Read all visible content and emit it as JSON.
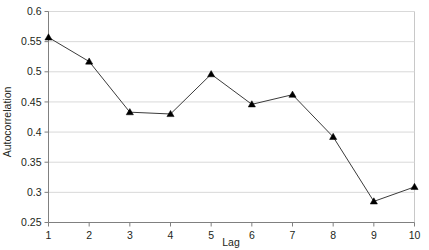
{
  "chart_data": {
    "type": "line",
    "title": "",
    "xlabel": "Lag",
    "ylabel": "Autocorrelation",
    "x": [
      1,
      2,
      3,
      4,
      5,
      6,
      7,
      8,
      9,
      10
    ],
    "categories": [
      "1",
      "2",
      "3",
      "4",
      "5",
      "6",
      "7",
      "8",
      "9",
      "10"
    ],
    "values": [
      0.557,
      0.517,
      0.433,
      0.43,
      0.496,
      0.446,
      0.462,
      0.392,
      0.285,
      0.309
    ],
    "series": [
      {
        "name": "Autocorrelation",
        "values": [
          0.557,
          0.517,
          0.433,
          0.43,
          0.496,
          0.446,
          0.462,
          0.392,
          0.285,
          0.309
        ]
      }
    ],
    "xlim": [
      1,
      10
    ],
    "ylim": [
      0.25,
      0.6
    ],
    "ytick_values": [
      0.25,
      0.3,
      0.35,
      0.4,
      0.45,
      0.5,
      0.55,
      0.6
    ],
    "ytick_labels": [
      "0.25",
      "0.3",
      "0.35",
      "0.4",
      "0.45",
      "0.5",
      "0.55",
      "0.6"
    ],
    "xtick_values": [
      1,
      2,
      3,
      4,
      5,
      6,
      7,
      8,
      9,
      10
    ],
    "xtick_labels": [
      "1",
      "2",
      "3",
      "4",
      "5",
      "6",
      "7",
      "8",
      "9",
      "10"
    ],
    "grid": "horizontal",
    "legend": "none",
    "marker": "triangle",
    "line_color": "#3b3b3b",
    "marker_color": "#000000",
    "grid_color": "#d9d9d9",
    "axis_color": "#808080",
    "background_color": "#ffffff"
  }
}
